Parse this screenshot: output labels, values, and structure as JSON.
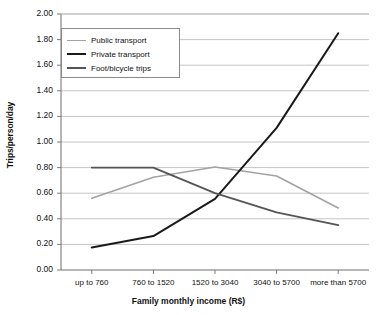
{
  "chart_data": {
    "type": "line",
    "title": "",
    "xlabel": "Family monthly income (R$)",
    "ylabel": "Trips/person/day",
    "categories": [
      "up to 760",
      "760 to 1520",
      "1520 to 3040",
      "3040 to 5700",
      "more than 5700"
    ],
    "ylim": [
      0.0,
      2.0
    ],
    "ytick_labels": [
      "0.00",
      "0.20",
      "0.40",
      "0.60",
      "0.80",
      "1.00",
      "1.20",
      "1.40",
      "1.60",
      "1.80",
      "2.00"
    ],
    "ytick_values": [
      0.0,
      0.2,
      0.4,
      0.6,
      0.8,
      1.0,
      1.2,
      1.4,
      1.6,
      1.8,
      2.0
    ],
    "grid": true,
    "legend_position": "upper-left-inside",
    "series": [
      {
        "name": "Public transport",
        "color": "#a3a3a3",
        "values": [
          0.56,
          0.725,
          0.805,
          0.735,
          0.485
        ]
      },
      {
        "name": "Private transport",
        "color": "#1a1a1a",
        "values": [
          0.175,
          0.265,
          0.555,
          1.11,
          1.85
        ]
      },
      {
        "name": "Foot/bicycle trips",
        "color": "#555555",
        "values": [
          0.8,
          0.8,
          0.6,
          0.45,
          0.35
        ]
      }
    ]
  },
  "axis": {
    "y_title": "Trips/person/day",
    "x_title": "Family monthly income (R$)"
  },
  "legend": {
    "items": [
      {
        "label": "Public transport"
      },
      {
        "label": "Private transport"
      },
      {
        "label": "Foot/bicycle trips"
      }
    ]
  },
  "colors": {
    "public_transport": "#a3a3a3",
    "private_transport": "#1a1a1a",
    "foot_bicycle": "#555555",
    "grid": "#b5b5b5",
    "axis": "#6f6f6f",
    "text": "#111111"
  }
}
